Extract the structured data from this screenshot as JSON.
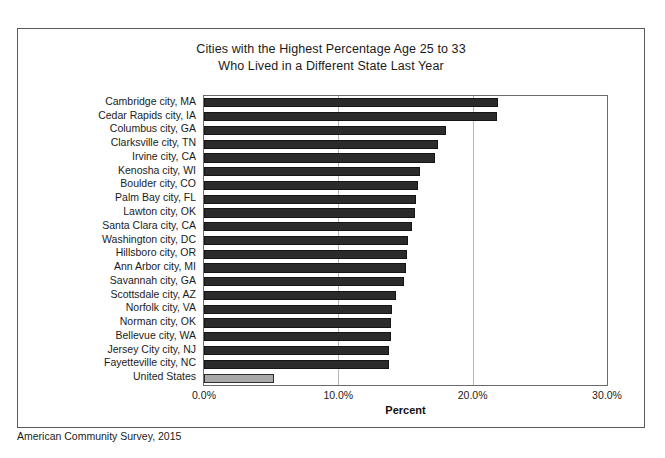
{
  "figure": {
    "title_line1": "Cities with the Highest Percentage Age 25 to 33",
    "title_line2": "Who Lived in a Different State Last Year",
    "source_note": "American Community Survey, 2015"
  },
  "chart_data": {
    "type": "bar",
    "orientation": "horizontal",
    "title": "Cities with the Highest Percentage Age 25 to 33 Who Lived in a Different State Last Year",
    "xlabel": "Percent",
    "ylabel": "",
    "xlim": [
      0,
      30
    ],
    "xticks": [
      0,
      10,
      20,
      30
    ],
    "xtick_labels": [
      "0.0%",
      "10.0%",
      "20.0%",
      "30.0%"
    ],
    "grid": "vertical",
    "legend": "none",
    "bar_color": "#2b2b2b",
    "highlight_color": "#a9a9a9",
    "categories": [
      "Cambridge city, MA",
      "Cedar Rapids city, IA",
      "Columbus city, GA",
      "Clarksville city, TN",
      "Irvine city, CA",
      "Kenosha city, WI",
      "Boulder city, CO",
      "Palm Bay city, FL",
      "Lawton city, OK",
      "Santa Clara city, CA",
      "Washington city, DC",
      "Hillsboro city, OR",
      "Ann Arbor city, MI",
      "Savannah city, GA",
      "Scottsdale city, AZ",
      "Norfolk city, VA",
      "Norman city, OK",
      "Bellevue city, WA",
      "Jersey City city, NJ",
      "Fayetteville city, NC",
      "United States"
    ],
    "values": [
      21.9,
      21.8,
      18.0,
      17.4,
      17.2,
      16.1,
      15.9,
      15.8,
      15.7,
      15.5,
      15.2,
      15.1,
      15.0,
      14.9,
      14.3,
      14.0,
      13.9,
      13.9,
      13.8,
      13.8,
      5.2
    ],
    "highlight_index": 20,
    "note": "American Community Survey, 2015"
  }
}
